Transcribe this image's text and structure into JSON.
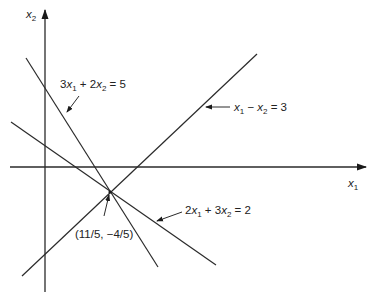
{
  "figure": {
    "type": "linear-equations-graph",
    "axes": {
      "x_label": {
        "base": "x",
        "sub": "1"
      },
      "y_label": {
        "base": "x",
        "sub": "2"
      }
    },
    "lines": [
      {
        "id": "line-a",
        "label_parts": [
          {
            "t": "3"
          },
          {
            "t": "x",
            "i": true
          },
          {
            "t": "1",
            "s": true
          },
          {
            "t": " + 2"
          },
          {
            "t": "x",
            "i": true
          },
          {
            "t": "2",
            "s": true
          },
          {
            "t": " = 5"
          }
        ],
        "equation": "3x1 + 2x2 = 5"
      },
      {
        "id": "line-b",
        "label_parts": [
          {
            "t": "x",
            "i": true
          },
          {
            "t": "1",
            "s": true
          },
          {
            "t": " − "
          },
          {
            "t": "x",
            "i": true
          },
          {
            "t": "2",
            "s": true
          },
          {
            "t": " = 3"
          }
        ],
        "equation": "x1 − x2 = 3"
      },
      {
        "id": "line-c",
        "label_parts": [
          {
            "t": "2"
          },
          {
            "t": "x",
            "i": true
          },
          {
            "t": "1",
            "s": true
          },
          {
            "t": " + 3"
          },
          {
            "t": "x",
            "i": true
          },
          {
            "t": "2",
            "s": true
          },
          {
            "t": " = 2"
          }
        ],
        "equation": "2x1 + 3x2 = 2"
      }
    ],
    "intersection": {
      "label": "(11/5, −4/5)",
      "x": "11/5",
      "y": "−4/5"
    }
  },
  "geometry": {
    "y_axis": {
      "x": 45,
      "y1": 292,
      "y2": 10
    },
    "x_axis": {
      "y": 167,
      "x1": 10,
      "x2": 366
    },
    "line_a": {
      "x1": 26,
      "y1": 58,
      "x2": 158,
      "y2": 267
    },
    "line_b": {
      "x1": 22,
      "y1": 276,
      "x2": 257,
      "y2": 54
    },
    "line_c": {
      "x1": 11,
      "y1": 122,
      "x2": 216,
      "y2": 265
    },
    "point": {
      "x": 110,
      "y": 192
    }
  }
}
